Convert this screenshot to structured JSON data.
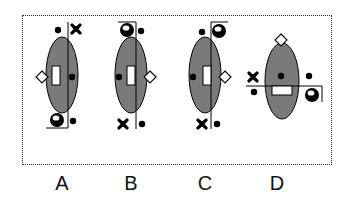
{
  "diagram": {
    "colors": {
      "ellipse_fill": "#7a7a7a",
      "stroke": "#000000",
      "symbol": "#000000",
      "border": "#333333"
    },
    "options": [
      {
        "label": "A",
        "cx": 62,
        "cy": 75,
        "elements": [
          "dot-top-left",
          "x-top-right",
          "diamond-left",
          "rect-center-left",
          "dot-right",
          "ball-bottom-left",
          "dot-bottom-right",
          "vertical-line",
          "bottom-bracket"
        ]
      },
      {
        "label": "B",
        "cx": 131,
        "cy": 75,
        "elements": [
          "ball-top-left",
          "dot-top-right",
          "dot-left",
          "rect-center-right",
          "diamond-right",
          "x-bottom-left",
          "dot-bottom-right",
          "vertical-line",
          "top-bracket"
        ]
      },
      {
        "label": "C",
        "cx": 205,
        "cy": 75,
        "elements": [
          "dot-top-left",
          "ball-top-right",
          "dot-left",
          "rect-center-right",
          "diamond-right",
          "x-bottom-left",
          "dot-bottom-right",
          "vertical-line",
          "top-bracket"
        ]
      },
      {
        "label": "D",
        "cx": 282,
        "cy": 80,
        "elements": [
          "diamond-top",
          "x-left",
          "dot-left-below",
          "dot-center-top",
          "rect-horizontal",
          "dot-right",
          "ball-right",
          "horizontal-line",
          "right-bracket"
        ]
      }
    ]
  }
}
